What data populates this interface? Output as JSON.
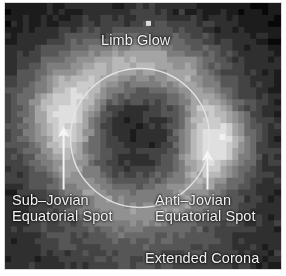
{
  "figure": {
    "kind": "astronomical-false-color-image",
    "frame_color": "#d8d8d8",
    "background_color": "#050505",
    "annotation_color": "#f2f2f2"
  },
  "annotations": {
    "limb_glow": {
      "label": "Limb Glow",
      "x": 96,
      "y": 30
    },
    "sub_jovian": {
      "label": "Sub–Jovian\nEquatorial Spot",
      "x": 7,
      "y": 190
    },
    "anti_jovian": {
      "label": "Anti–Jovian\nEquatorial Spot",
      "x": 150,
      "y": 190
    },
    "extended_corona": {
      "label": "Extended Corona",
      "x": 140,
      "y": 248
    }
  },
  "overlay": {
    "disk_circle": {
      "name": "satellite-disk-outline",
      "cx": 140,
      "cy": 138,
      "r": 70,
      "stroke": "#e6e6e6",
      "stroke_width": 1.4
    },
    "arrows": [
      {
        "name": "sub-jovian-arrow",
        "x1": 63,
        "y1": 186,
        "x2": 63,
        "y2": 131,
        "stroke": "#f5f5f5",
        "stroke_width": 2.2
      },
      {
        "name": "anti-jovian-arrow",
        "x1": 208,
        "y1": 186,
        "x2": 208,
        "y2": 155,
        "stroke": "#f5f5f5",
        "stroke_width": 2.2
      }
    ]
  },
  "chart_data": {
    "type": "heatmap",
    "title": "",
    "xlabel": "",
    "ylabel": "",
    "colormap": "grayscale",
    "grid": false,
    "legend": "none",
    "nx": 46,
    "ny": 44,
    "value_range": [
      0,
      1
    ],
    "features": [
      {
        "name": "limb-glow",
        "description": "diffuse brightening along upper limb of disk",
        "center": [
          140,
          62
        ],
        "relative_intensity": 0.45
      },
      {
        "name": "sub-jovian-equatorial-spot",
        "description": "bright blob just outside disk on the left (sub-Jovian) side",
        "center": [
          58,
          112
        ],
        "relative_intensity": 0.72
      },
      {
        "name": "anti-jovian-equatorial-spot",
        "description": "bright blob just outside disk on the right (anti-Jovian) side",
        "center": [
          216,
          140
        ],
        "relative_intensity": 0.8
      },
      {
        "name": "extended-corona",
        "description": "faint broad halo filling the lower field of view",
        "center": [
          140,
          230
        ],
        "relative_intensity": 0.22
      },
      {
        "name": "central-disk",
        "description": "darker circular disk of the satellite",
        "center": [
          140,
          138
        ],
        "relative_intensity": 0.12
      }
    ]
  }
}
